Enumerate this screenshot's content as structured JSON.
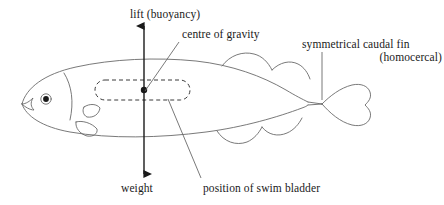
{
  "figure": {
    "background_color": "#ffffff",
    "line_color": "#6a6a6a",
    "arrow_color": "#1a1a1a",
    "text_color": "#1a1a1a"
  },
  "labels": {
    "lift": "lift (buoyancy)",
    "centre_of_gravity": "centre of gravity",
    "caudal_fin": "symmetrical caudal fin",
    "homocercal": "(homocercal)",
    "weight": "weight",
    "swim_bladder": "position of swim bladder"
  },
  "diagram": {
    "force_arrow_up": "lift-arrow",
    "force_arrow_down": "weight-arrow",
    "centre_of_gravity_point": "centre-of-gravity-dot",
    "swim_bladder_shape": "dashed-rounded-rectangle",
    "fish_parts": [
      "body-outline",
      "eye",
      "gill-cover",
      "pectoral-fin",
      "pelvic-fin",
      "dorsal-fin-first",
      "dorsal-fin-second",
      "anal-fin-first",
      "anal-fin-second",
      "caudal-fin"
    ]
  }
}
